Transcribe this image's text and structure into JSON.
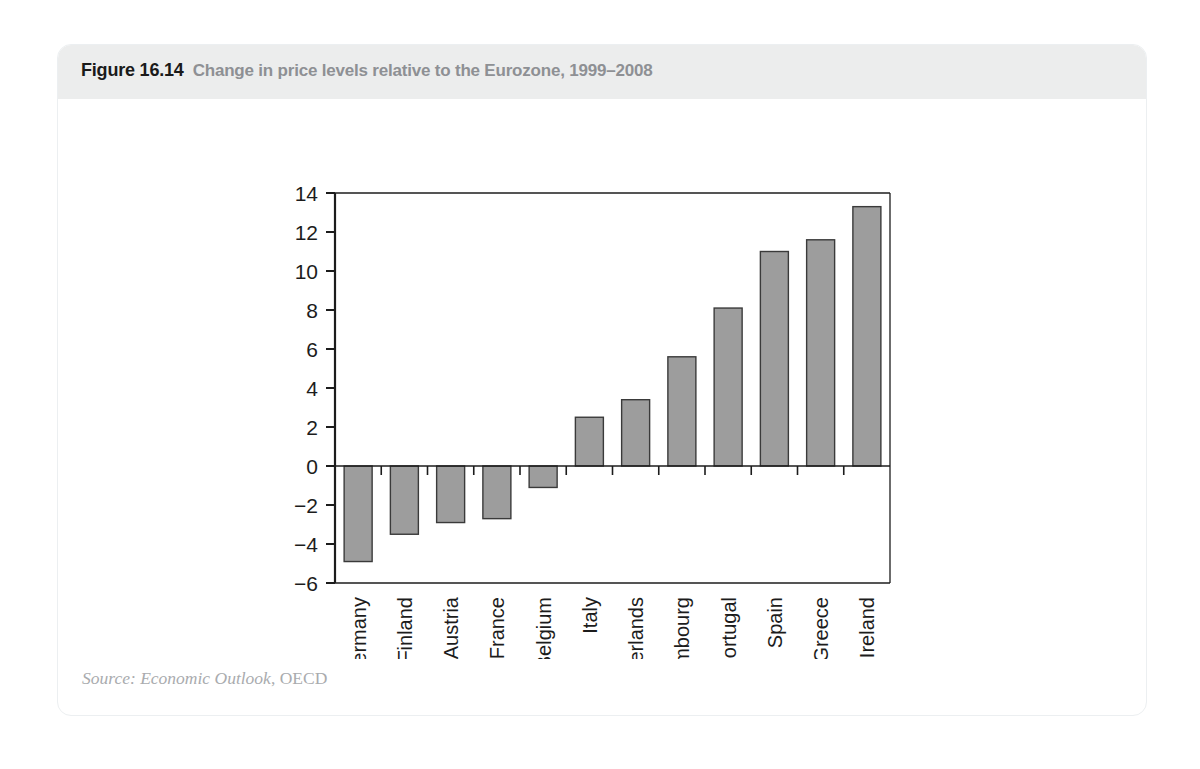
{
  "figure": {
    "number": "Figure 16.14",
    "title": "Change in price levels relative to the Eurozone, 1999–2008",
    "source_prefix": "Source: Economic Outlook",
    "source_suffix": ", OECD"
  },
  "colors": {
    "header_band": "#eceded",
    "caption_number": "#1a1a1a",
    "caption_title": "#8e9094",
    "bar_fill": "#9d9d9d",
    "bar_stroke": "#3a3a3a",
    "axis": "#1c1c1c",
    "source_text": "#a9abae",
    "card_border": "#eceff1"
  },
  "chart_data": {
    "type": "bar",
    "title": "Change in price levels relative to the Eurozone, 1999–2008",
    "xlabel": "",
    "ylabel": "",
    "ylim": [
      -6,
      14
    ],
    "yticks": [
      -6,
      -4,
      -2,
      0,
      2,
      4,
      6,
      8,
      10,
      12,
      14
    ],
    "ytick_labels": [
      "−6",
      "−4",
      "−2",
      "0",
      "2",
      "4",
      "6",
      "8",
      "10",
      "12",
      "14"
    ],
    "grid": false,
    "legend": null,
    "categories": [
      "Germany",
      "Finland",
      "Austria",
      "France",
      "Belgium",
      "Italy",
      "Netherlands",
      "Luxembourg",
      "Portugal",
      "Spain",
      "Greece",
      "Ireland"
    ],
    "values": [
      -4.9,
      -3.5,
      -2.9,
      -2.7,
      -1.1,
      2.5,
      3.4,
      5.6,
      8.1,
      11.0,
      11.6,
      13.3
    ]
  }
}
